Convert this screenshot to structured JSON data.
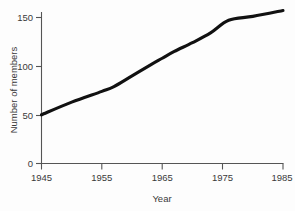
{
  "chart_data": {
    "type": "line",
    "title": "",
    "subtitle": "",
    "xlabel": "Year",
    "ylabel": "Number of members",
    "xlim": [
      1945,
      1985
    ],
    "ylim": [
      0,
      160
    ],
    "xticks": [
      1945,
      1955,
      1965,
      1975,
      1985
    ],
    "xtick_labels": [
      "1945",
      "1955",
      "1965",
      "1975",
      "1985"
    ],
    "yticks": [
      0,
      50,
      100,
      150
    ],
    "ytick_labels": [
      "0",
      "50",
      "100",
      "150"
    ],
    "grid": false,
    "legend": null,
    "line_color": "#111111",
    "axis_color": "#555555",
    "background_color": "#fdfdfd",
    "series": [
      {
        "name": "Number of members",
        "x": [
          1945,
          1950,
          1955,
          1957,
          1960,
          1963,
          1965,
          1967,
          1970,
          1973,
          1976,
          1980,
          1985
        ],
        "values": [
          50,
          63,
          74,
          79,
          90,
          101,
          108,
          115,
          124,
          134,
          147,
          151,
          157
        ]
      }
    ]
  },
  "axis": {
    "y_title": "Number of members",
    "x_title": "Year",
    "y_labels": [
      "150",
      "100",
      "50",
      "0"
    ],
    "x_labels": [
      "1945",
      "1955",
      "1965",
      "1975",
      "1985"
    ]
  }
}
